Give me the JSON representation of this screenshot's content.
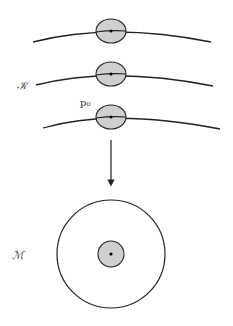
{
  "diagram": {
    "labels": {
      "K": "𝒦",
      "M": "ℳ",
      "p0": "p₀"
    },
    "colors": {
      "stroke": "#222222",
      "fill": "#cfcfcf",
      "background": "#ffffff"
    },
    "curves": [
      {
        "name": "curve-top",
        "y_center": 31
      },
      {
        "name": "curve-middle",
        "y_center": 74
      },
      {
        "name": "curve-bottom",
        "y_center": 117
      }
    ],
    "arrow": {
      "from_y": 140,
      "to_y": 187
    },
    "outer_circle": {
      "cx": 111,
      "cy": 254,
      "r": 54
    },
    "inner_disk": {
      "cx": 111,
      "cy": 254,
      "r": 13
    }
  }
}
